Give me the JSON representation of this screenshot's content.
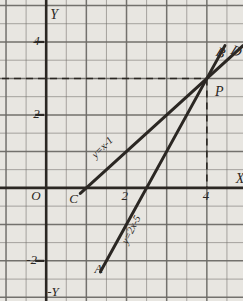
{
  "figure": {
    "background": "#e8e6e1",
    "ink": "#2b2723",
    "grid_color": "#6d6a66",
    "axis_color": "#2b2723"
  },
  "axes": {
    "x_label": "X",
    "y_label": "Y",
    "y_label_negative": "-Y",
    "origin_label": "O",
    "x_ticks": [
      {
        "label": "2",
        "value": 2
      },
      {
        "label": "4",
        "value": 4
      }
    ],
    "y_ticks": [
      {
        "label": "2",
        "value": 2
      },
      {
        "label": "4",
        "value": 4
      },
      {
        "label": "-2",
        "value": -2
      }
    ],
    "xlim": [
      -1.15,
      4.9
    ],
    "ylim": [
      -3.1,
      5.15
    ],
    "grid": true,
    "grid_step": 0.5
  },
  "points": [
    {
      "name": "A",
      "label": "A",
      "x": 1.5,
      "y": -2.0
    },
    {
      "name": "B",
      "label": "B",
      "x": 4.35,
      "y": 3.7
    },
    {
      "name": "C",
      "label": "C",
      "x": 0.65,
      "y": -0.1
    },
    {
      "name": "D",
      "label": "D",
      "x": 4.72,
      "y": 3.75
    },
    {
      "name": "P",
      "label": "P",
      "x": 4.15,
      "y": 2.75
    }
  ],
  "chart_data": {
    "type": "line",
    "title": "",
    "xlabel": "X",
    "ylabel": "Y",
    "xlim": [
      -1.15,
      4.9
    ],
    "ylim": [
      -3.1,
      5.15
    ],
    "grid": true,
    "series": [
      {
        "name": "line-CD",
        "equation": "y=x-1",
        "slope": 1,
        "intercept": -1,
        "endpoints": [
          {
            "x": 0.85,
            "y": -0.15
          },
          {
            "x": 4.9,
            "y": 3.9
          }
        ],
        "x_intercept": 1,
        "label_point": {
          "x": 1.55,
          "y": 0.85
        }
      },
      {
        "name": "line-AB",
        "equation": "y=2x-5",
        "slope": 2,
        "intercept": -5,
        "endpoints": [
          {
            "x": 1.35,
            "y": -2.3
          },
          {
            "x": 4.45,
            "y": 3.9
          }
        ],
        "x_intercept": 2.5,
        "label_point": {
          "x": 2.08,
          "y": -1.5
        }
      }
    ],
    "intersection": {
      "x": 4,
      "y": 3,
      "label": "P"
    },
    "guides": [
      {
        "type": "horizontal-dashed",
        "y": 3,
        "from_x": -1.1,
        "to_x": 4
      },
      {
        "type": "vertical-dashed",
        "x": 4,
        "from_y": 3,
        "to_y": 0
      }
    ],
    "annotations": [
      {
        "text": "y=x-1",
        "rotation": -45
      },
      {
        "text": "y=2x-5",
        "rotation": -63
      }
    ]
  }
}
